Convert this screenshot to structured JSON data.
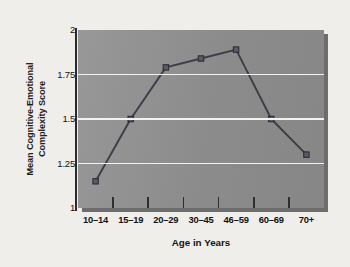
{
  "chart_data": {
    "type": "line",
    "title": "",
    "xlabel": "Age in Years",
    "ylabel": "Mean Cognitive-Emotional Complexity Score",
    "ylabel_line1": "Mean Cognitive-Emotional",
    "ylabel_line2": "Complexity Score",
    "categories": [
      "10–14",
      "15–19",
      "20–29",
      "30–45",
      "46–59",
      "60–69",
      "70+"
    ],
    "values": [
      1.15,
      1.5,
      1.79,
      1.84,
      1.89,
      1.5,
      1.3
    ],
    "ylim": [
      1,
      2
    ],
    "yticks": [
      1,
      1.25,
      1.5,
      1.75,
      2
    ],
    "ytick_labels": [
      "1",
      "1.25",
      "1.5",
      "1.75",
      "2"
    ],
    "grid": "horizontal",
    "legend": "none",
    "marker": "square",
    "colors": {
      "plot_background": "#949494",
      "gridline": "#f2f2f0",
      "line": "#3a3a46",
      "marker_fill": "#5a5a66",
      "marker_edge": "#2a2a34",
      "axis": "#2a2a2a",
      "page_background": "#efeeea",
      "text": "#121212"
    }
  }
}
